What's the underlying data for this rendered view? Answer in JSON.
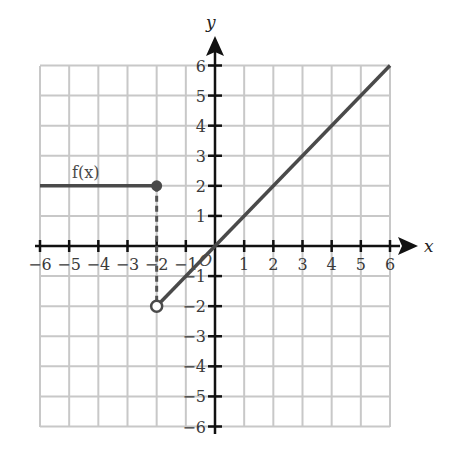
{
  "chart_data": {
    "type": "line",
    "title": "",
    "xlabel": "x",
    "ylabel": "y",
    "xlim": [
      -6,
      6
    ],
    "ylim": [
      -6,
      6
    ],
    "grid": true,
    "x_ticks": [
      -6,
      -5,
      -4,
      -3,
      -2,
      -1,
      1,
      2,
      3,
      4,
      5,
      6
    ],
    "y_ticks": [
      -6,
      -5,
      -4,
      -3,
      -2,
      -1,
      1,
      2,
      3,
      4,
      5,
      6
    ],
    "origin_label": "O",
    "function_label": "f(x)",
    "series": [
      {
        "name": "f(x) piece 1",
        "description": "constant y = 2 for x <= -2",
        "points": [
          [
            -6,
            2
          ],
          [
            -2,
            2
          ]
        ],
        "endpoint": {
          "x": -2,
          "y": 2,
          "style": "closed"
        }
      },
      {
        "name": "f(x) piece 2",
        "description": "y = x for x > -2",
        "points": [
          [
            -2,
            -2
          ],
          [
            6,
            6
          ]
        ],
        "endpoint": {
          "x": -2,
          "y": -2,
          "style": "open"
        }
      }
    ],
    "annotations": [
      {
        "type": "dashed-vertical",
        "x": -2,
        "from_y": 2,
        "to_y": -2
      }
    ]
  },
  "labels": {
    "x_axis": "x",
    "y_axis": "y",
    "function": "f(x)",
    "origin": "O",
    "x_ticks": [
      "−6",
      "−5",
      "−4",
      "−3",
      "−2",
      "−1",
      "1",
      "2",
      "3",
      "4",
      "5",
      "6"
    ],
    "y_ticks": [
      "6",
      "5",
      "4",
      "3",
      "2",
      "1",
      "−1",
      "−2",
      "−3",
      "−4",
      "−5",
      "−6"
    ]
  },
  "colors": {
    "grid": "#c8c8c8",
    "axis": "#111111",
    "graph": "#4a4a4a"
  }
}
